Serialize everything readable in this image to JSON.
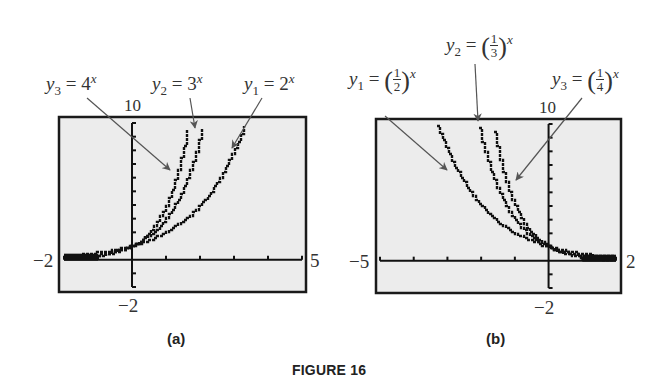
{
  "figure_title": "FIGURE 16",
  "chart_data": [
    {
      "type": "line",
      "panel": "(a)",
      "caption": "(a)",
      "xlim": [
        -2,
        5
      ],
      "ylim": [
        -2,
        10
      ],
      "xtick_step": 1,
      "ytick_step": 1,
      "window_labels": {
        "xmin": "−2",
        "xmax": "5",
        "ymin": "−2",
        "ymax": "10"
      },
      "series": [
        {
          "name": "y1 = 2^x",
          "label_main": "y",
          "label_sub": "1",
          "label_rhs": "= 2",
          "label_exp": "x",
          "base": 2
        },
        {
          "name": "y2 = 3^x",
          "label_main": "y",
          "label_sub": "2",
          "label_rhs": "= 3",
          "label_exp": "x",
          "base": 3
        },
        {
          "name": "y3 = 4^x",
          "label_main": "y",
          "label_sub": "3",
          "label_rhs": "= 4",
          "label_exp": "x",
          "base": 4
        }
      ],
      "grid": false,
      "style": "graphing-calculator screen"
    },
    {
      "type": "line",
      "panel": "(b)",
      "caption": "(b)",
      "xlim": [
        -5,
        2
      ],
      "ylim": [
        -2,
        10
      ],
      "xtick_step": 1,
      "ytick_step": 1,
      "window_labels": {
        "xmin": "−5",
        "xmax": "2",
        "ymin": "−2",
        "ymax": "10"
      },
      "series": [
        {
          "name": "y1 = (1/2)^x",
          "label_main": "y",
          "label_sub": "1",
          "label_num": "1",
          "label_den": "2",
          "label_exp": "x",
          "base": 0.5
        },
        {
          "name": "y2 = (1/3)^x",
          "label_main": "y",
          "label_sub": "2",
          "label_num": "1",
          "label_den": "3",
          "label_exp": "x",
          "base": 0.3333
        },
        {
          "name": "y3 = (1/4)^x",
          "label_main": "y",
          "label_sub": "3",
          "label_num": "1",
          "label_den": "4",
          "label_exp": "x",
          "base": 0.25
        }
      ],
      "grid": false,
      "style": "graphing-calculator screen"
    }
  ],
  "colors": {
    "screen_bg": "#ececec",
    "frame": "#1a1a1a",
    "curve": "#111111",
    "arrow": "#555555",
    "text": "#333333"
  }
}
